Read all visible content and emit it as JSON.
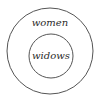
{
  "diagram": {
    "type": "euler-nested-sets",
    "outer_set": {
      "label": "women"
    },
    "inner_set": {
      "label": "widows"
    },
    "relation": "widows is a subset of women",
    "stroke_color": "#555555",
    "text_color": "#2a2a2a",
    "background": "#ffffff"
  }
}
